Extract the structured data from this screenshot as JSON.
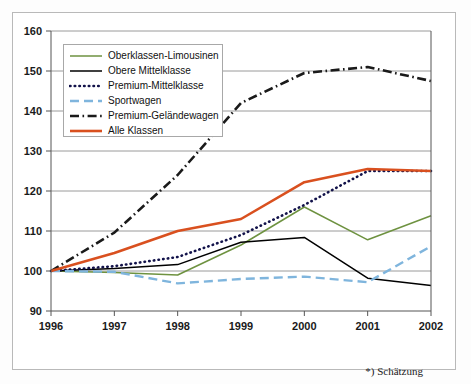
{
  "chart_data": {
    "type": "line",
    "title": "",
    "subtitle": "",
    "xlabel": "",
    "ylabel": "",
    "xlim": [
      1996,
      2002
    ],
    "ylim": [
      90,
      160
    ],
    "ytick_step": 10,
    "grid": true,
    "legend_position": "upper-left-inside",
    "x": [
      1996,
      1997,
      1998,
      1999,
      2000,
      2001,
      2002
    ],
    "categories": [
      "1996",
      "1997",
      "1998",
      "1999",
      "2000",
      "2001",
      "2002"
    ],
    "ytick_labels": [
      "90",
      "100",
      "110",
      "120",
      "130",
      "140",
      "150",
      "160"
    ],
    "ytick_values": [
      90,
      100,
      110,
      120,
      130,
      140,
      150,
      160
    ],
    "annotations": [
      "*) Schätzung"
    ],
    "series": [
      {
        "name": "Oberklassen-Limousinen",
        "color": "#6e9240",
        "style": "solid",
        "values": [
          100,
          99.6,
          99,
          106.5,
          116,
          107.8,
          113.8
        ]
      },
      {
        "name": "Obere Mittelklasse",
        "color": "#000000",
        "style": "solid",
        "values": [
          100,
          100.6,
          101.6,
          107.2,
          108.4,
          98.2,
          96.4
        ]
      },
      {
        "name": "Premium-Mittelklasse",
        "color": "#12124a",
        "style": "dotted",
        "values": [
          100,
          101.2,
          103.5,
          109,
          116.5,
          125,
          125
        ]
      },
      {
        "name": "Sportwagen",
        "color": "#7fb5dd",
        "style": "dashed",
        "values": [
          100,
          99.8,
          96.9,
          98,
          98.6,
          97.2,
          106.2
        ]
      },
      {
        "name": "Premium-Geländewagen",
        "color": "#1a1a1a",
        "style": "dash-dot",
        "values": [
          100,
          109.6,
          124,
          142,
          149.5,
          151,
          147.5
        ]
      },
      {
        "name": "Alle Klassen",
        "color": "#d9501f",
        "style": "solid-thick",
        "values": [
          100,
          104.5,
          110,
          113,
          122.2,
          125.5,
          125
        ]
      }
    ]
  },
  "footnote": {
    "text": "*) Schätzung"
  },
  "legend": {
    "items": [
      {
        "label": "Oberklassen-Limousinen",
        "color": "#6e9240",
        "style": "solid"
      },
      {
        "label": "Obere Mittelklasse",
        "color": "#000000",
        "style": "solid"
      },
      {
        "label": "Premium-Mittelklasse",
        "color": "#12124a",
        "style": "dotted"
      },
      {
        "label": "Sportwagen",
        "color": "#7fb5dd",
        "style": "dashed"
      },
      {
        "label": "Premium-Geländewagen",
        "color": "#1a1a1a",
        "style": "dash-dot"
      },
      {
        "label": "Alle Klassen",
        "color": "#d9501f",
        "style": "solid-thick"
      }
    ]
  }
}
